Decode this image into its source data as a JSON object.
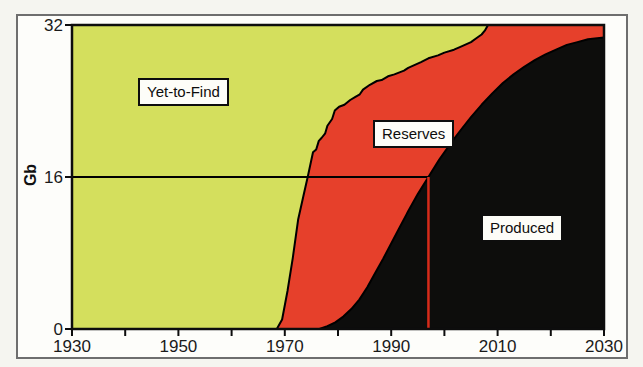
{
  "figure": {
    "background": "#f5f5f0",
    "frame_border_color": "#6e6e6e",
    "plot_background": "#ffffff"
  },
  "labels": {
    "yet_to_find": "Yet-to-Find",
    "reserves": "Reserves",
    "produced": "Produced",
    "ylabel": "Gb"
  },
  "chart_data": {
    "type": "area",
    "title": "",
    "xlabel": "",
    "ylabel": "Gb",
    "xlim": [
      1930,
      2030
    ],
    "ylim": [
      0,
      32
    ],
    "grid": false,
    "x_major_ticks": {
      "values": [
        1930,
        1950,
        1970,
        1990,
        2010,
        2030
      ],
      "labels": [
        "1930",
        "1950",
        "1970",
        "1990",
        "2010",
        "2030"
      ]
    },
    "x_minor_ticks": [
      1940,
      1960,
      1980,
      2000,
      2020
    ],
    "y_ticks": {
      "values": [
        0,
        16,
        32
      ],
      "labels": [
        "0",
        "16",
        "32"
      ]
    },
    "areas": [
      {
        "name": "Yet-to-Find",
        "color": "#d4df5d",
        "description": "between cumulative-discovery curve and 32 Gb ultimate"
      },
      {
        "name": "Reserves",
        "color": "#e6402b",
        "description": "between cumulative-production and cumulative-discovery curves"
      },
      {
        "name": "Produced",
        "color": "#0d0d0c",
        "description": "below cumulative-production curve"
      }
    ],
    "series": [
      {
        "name": "cumulative-discovery",
        "points": [
          [
            1930,
            0
          ],
          [
            1968.5,
            0
          ],
          [
            1969.5,
            1
          ],
          [
            1970.5,
            4
          ],
          [
            1971.5,
            7.5
          ],
          [
            1972.5,
            11.5
          ],
          [
            1973.5,
            14
          ],
          [
            1974.3,
            16
          ],
          [
            1975.3,
            18.6
          ],
          [
            1975.9,
            18.9
          ],
          [
            1976.4,
            19.8
          ],
          [
            1976.9,
            20.1
          ],
          [
            1977.6,
            20.6
          ],
          [
            1978.0,
            21.4
          ],
          [
            1978.9,
            22.1
          ],
          [
            1979.4,
            23.0
          ],
          [
            1980.2,
            23.4
          ],
          [
            1981.2,
            23.6
          ],
          [
            1982.3,
            24.1
          ],
          [
            1983.2,
            24.4
          ],
          [
            1984.1,
            24.7
          ],
          [
            1984.7,
            25.2
          ],
          [
            1986.0,
            25.7
          ],
          [
            1987.3,
            26.1
          ],
          [
            1988.2,
            26.2
          ],
          [
            1989.4,
            26.6
          ],
          [
            1990.6,
            26.8
          ],
          [
            1992.4,
            27.2
          ],
          [
            1993.2,
            27.5
          ],
          [
            1995.6,
            28.1
          ],
          [
            1997.0,
            28.5
          ],
          [
            1998.8,
            28.8
          ],
          [
            2000.0,
            29.1
          ],
          [
            2001.8,
            29.4
          ],
          [
            2003.0,
            29.7
          ],
          [
            2005.0,
            30.2
          ],
          [
            2006.0,
            30.6
          ],
          [
            2007.0,
            31.0
          ],
          [
            2007.6,
            31.4
          ],
          [
            2008.2,
            32
          ],
          [
            2030,
            32
          ]
        ]
      },
      {
        "name": "cumulative-production",
        "points": [
          [
            1930,
            0
          ],
          [
            1976.5,
            0
          ],
          [
            1978,
            0.3
          ],
          [
            1979.5,
            0.7
          ],
          [
            1981,
            1.3
          ],
          [
            1982.5,
            2.1
          ],
          [
            1984,
            3.1
          ],
          [
            1985.5,
            4.4
          ],
          [
            1987,
            5.9
          ],
          [
            1988.5,
            7.4
          ],
          [
            1990,
            9.0
          ],
          [
            1991.5,
            10.6
          ],
          [
            1993,
            12.2
          ],
          [
            1995,
            14.2
          ],
          [
            1997,
            16
          ],
          [
            1999,
            17.8
          ],
          [
            2001,
            19.4
          ],
          [
            2003,
            20.9
          ],
          [
            2005,
            22.3
          ],
          [
            2007,
            23.6
          ],
          [
            2009,
            24.8
          ],
          [
            2011,
            25.9
          ],
          [
            2013,
            26.8
          ],
          [
            2015,
            27.6
          ],
          [
            2017,
            28.3
          ],
          [
            2019,
            28.9
          ],
          [
            2021,
            29.4
          ],
          [
            2023,
            29.9
          ],
          [
            2025,
            30.2
          ],
          [
            2027,
            30.5
          ],
          [
            2030,
            30.7
          ]
        ]
      }
    ],
    "annotations": {
      "midpoint_h_line": {
        "gb": 16,
        "from_year": 1930,
        "to_year": 1997,
        "color": "#000000"
      },
      "midpoint_v_line": {
        "year": 1997,
        "from_gb": 0,
        "to_gb": 16,
        "color": "#d62b1a"
      }
    },
    "legend": "none (labels boxed inside areas)"
  }
}
